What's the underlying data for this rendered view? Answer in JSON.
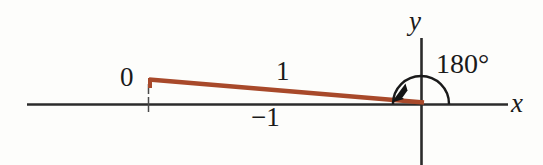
{
  "figure": {
    "colors": {
      "vector": "#a8492a",
      "axis": "#2b2b2b",
      "arc": "#1a1a1a",
      "text": "#1a1a1a",
      "background": "#fdfdfb"
    },
    "axes": {
      "x_label": "x",
      "y_label": "y",
      "x_axis_y_px": 104,
      "x_axis_start_px": 27,
      "x_axis_end_px": 508,
      "y_axis_x_px": 421,
      "y_axis_top_px": 38,
      "y_axis_bottom_px": 165
    },
    "labels": {
      "zero": "0",
      "one": "1",
      "negative_one": "−1",
      "angle": "180°"
    },
    "vector": {
      "start_x_px": 148,
      "start_y_px": 79,
      "end_x_px": 424,
      "end_y_px": 103,
      "stroke_width_px": 4
    },
    "arc": {
      "center_x_px": 421,
      "center_y_px": 104,
      "radius_px": 28,
      "sweep_degrees": 180
    },
    "tick": {
      "x_px": 148,
      "top_y_px": 84,
      "bottom_y_px": 112
    },
    "arrowhead": {
      "tip_x_px": 393,
      "tip_y_px": 101,
      "direction": "down-left"
    }
  }
}
